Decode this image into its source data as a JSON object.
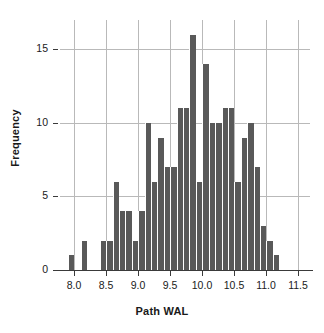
{
  "chart_data": {
    "type": "bar",
    "title": "",
    "subtitle": "",
    "xlabel": "Path WAL",
    "ylabel": "Frequency",
    "xlim": [
      7.78,
      11.68
    ],
    "ylim": [
      0,
      17
    ],
    "grid": true,
    "legend": null,
    "bin_width": 0.1,
    "bin_starts": [
      7.9,
      8.0,
      8.1,
      8.2,
      8.3,
      8.4,
      8.5,
      8.6,
      8.7,
      8.8,
      8.9,
      9.0,
      9.1,
      9.2,
      9.3,
      9.4,
      9.5,
      9.6,
      9.7,
      9.8,
      9.9,
      10.0,
      10.1,
      10.2,
      10.3,
      10.4,
      10.5,
      10.6,
      10.7,
      10.8,
      10.9,
      11.0,
      11.1,
      11.2,
      11.3,
      11.4
    ],
    "categories": [
      "7.9",
      "8.0",
      "8.1",
      "8.2",
      "8.3",
      "8.4",
      "8.5",
      "8.6",
      "8.7",
      "8.8",
      "8.9",
      "9.0",
      "9.1",
      "9.2",
      "9.3",
      "9.4",
      "9.5",
      "9.6",
      "9.7",
      "9.8",
      "9.9",
      "10.0",
      "10.1",
      "10.2",
      "10.3",
      "10.4",
      "10.5",
      "10.6",
      "10.7",
      "10.8",
      "10.9",
      "11.0",
      "11.1",
      "11.2",
      "11.3",
      "11.4"
    ],
    "values": [
      1,
      0,
      2,
      0,
      0,
      2,
      2,
      6,
      4,
      4,
      2,
      4,
      10,
      6,
      9,
      7,
      7,
      11,
      11,
      16,
      6,
      14,
      10,
      10,
      11,
      11,
      6,
      9,
      10,
      7,
      3,
      2,
      1,
      0,
      0,
      0
    ],
    "xticks": [
      8.0,
      8.5,
      9.0,
      9.5,
      10.0,
      10.5,
      11.0,
      11.5
    ],
    "xticklabels": [
      "8.0",
      "8.5",
      "9.0",
      "9.5",
      "10.0",
      "10.5",
      "11.0",
      "11.5"
    ],
    "yticks": [
      0,
      5,
      10,
      15
    ],
    "yticklabels": [
      "0",
      "5",
      "10",
      "15"
    ],
    "bar_color": "#595959",
    "grid_color": "#b9b9b9",
    "axis_color": "#3a3a3a",
    "background_color": "#ffffff"
  }
}
